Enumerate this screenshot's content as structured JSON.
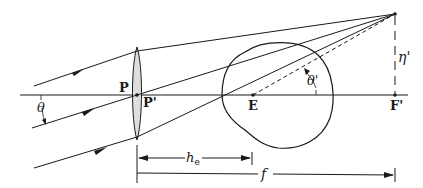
{
  "labels": {
    "P": "P",
    "P_prime": "P'",
    "E": "E",
    "F_prime": "F'",
    "theta": "θ",
    "theta_prime": "θ'",
    "eta_prime": "η'",
    "h_e": "h",
    "h_e_sub": "e",
    "f": "f"
  },
  "colors": {
    "line": "#1a1a1a",
    "lens_fill": "#dedede"
  }
}
